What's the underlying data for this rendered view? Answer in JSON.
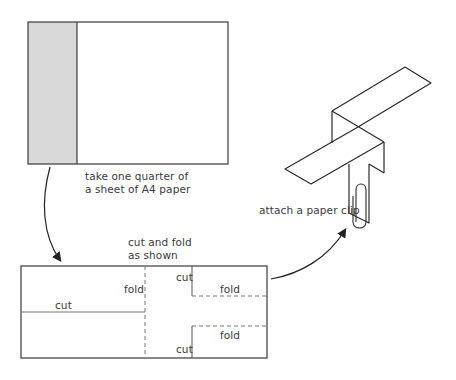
{
  "diagram": {
    "steps": [
      {
        "id": "step-1",
        "caption_line1": "take one quarter of",
        "caption_line2": "a sheet of A4 paper"
      },
      {
        "id": "step-2",
        "caption_line1": "cut and fold",
        "caption_line2": "as shown",
        "labels": {
          "left_fold": "fold",
          "left_cut": "cut",
          "top_right_cut": "cut",
          "top_right_fold": "fold",
          "bottom_right_cut": "cut",
          "bottom_right_fold": "fold"
        }
      },
      {
        "id": "step-3",
        "caption": "attach a paper clip"
      }
    ],
    "colors": {
      "line": "#3a3a3a",
      "shaded_strip": "#d9d9d9",
      "paper": "#ffffff"
    }
  }
}
